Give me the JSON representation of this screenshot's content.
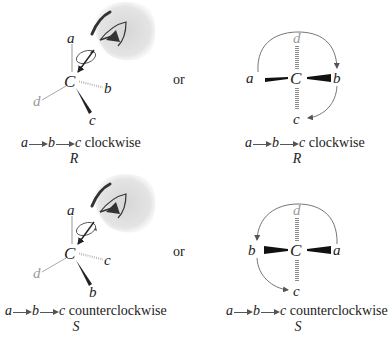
{
  "separator_word": "or",
  "colors": {
    "bond": "#222222",
    "gray_substituent": "#9a9a9a",
    "hashed_bond": "#8a8a8a",
    "arrow": "#555555",
    "eye_shadow": "#e2e2e2"
  },
  "panels": [
    {
      "id": "r-perspective",
      "view": "3D wedge-dash with eye looking down C-d bond",
      "center": "C",
      "substituents": {
        "up": "a",
        "right_hashed": "b",
        "down_wedge": "c",
        "left_gray": "d"
      },
      "caption": {
        "seq": [
          "a",
          "b",
          "c"
        ],
        "direction": "clockwise",
        "config": "R"
      },
      "icons": [
        "eye-icon",
        "rotation-arrow-icon"
      ]
    },
    {
      "id": "r-fischer",
      "view": "Projection with d away (hashed, vertical)",
      "center": "C",
      "substituents": {
        "left_wedge": "a",
        "right_wedge": "b",
        "top_hashed_gray": "d",
        "bottom_hashed": "c"
      },
      "caption": {
        "seq": [
          "a",
          "b",
          "c"
        ],
        "direction": "clockwise",
        "config": "R"
      }
    },
    {
      "id": "s-perspective",
      "view": "3D wedge-dash with eye looking down C-d bond",
      "center": "C",
      "substituents": {
        "up": "a",
        "right_hashed": "c",
        "down_wedge": "b",
        "left_gray": "d"
      },
      "caption": {
        "seq": [
          "a",
          "b",
          "c"
        ],
        "direction": "counterclockwise",
        "config": "S"
      },
      "icons": [
        "eye-icon",
        "rotation-arrow-icon"
      ]
    },
    {
      "id": "s-fischer",
      "view": "Projection with d away (hashed, vertical)",
      "center": "C",
      "substituents": {
        "left_wedge": "b",
        "right_wedge": "a",
        "top_hashed_gray": "d",
        "bottom_hashed": "c"
      },
      "caption": {
        "seq": [
          "a",
          "b",
          "c"
        ],
        "direction": "counterclockwise",
        "config": "S"
      }
    }
  ],
  "labels": {
    "top_left": {
      "a": "a",
      "b": "b",
      "c": "c",
      "d": "d",
      "C": "C"
    },
    "top_right": {
      "a": "a",
      "b": "b",
      "c": "c",
      "d": "d",
      "C": "C"
    },
    "bottom_left": {
      "a": "a",
      "b": "b",
      "c": "c",
      "d": "d",
      "C": "C"
    },
    "bottom_right": {
      "a": "a",
      "b": "b",
      "c": "c",
      "d": "d",
      "C": "C"
    }
  },
  "captions": {
    "top_left": {
      "v1": "a",
      "v2": "b",
      "v3": "c",
      "word": "clockwise",
      "config": "R"
    },
    "top_right": {
      "v1": "a",
      "v2": "b",
      "v3": "c",
      "word": "clockwise",
      "config": "R"
    },
    "bottom_left": {
      "v1": "a",
      "v2": "b",
      "v3": "c",
      "word": "counterclockwise",
      "config": "S"
    },
    "bottom_right": {
      "v1": "a",
      "v2": "b",
      "v3": "c",
      "word": "counterclockwise",
      "config": "S"
    }
  }
}
